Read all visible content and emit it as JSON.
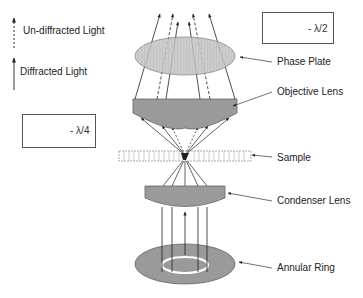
{
  "legend": {
    "undiffracted": "Un-diffracted Light",
    "diffracted": "Diffracted Light"
  },
  "phase_boxes": {
    "top_right": "- λ/2",
    "left": "- λ/4"
  },
  "labels": {
    "phase_plate": "Phase Plate",
    "objective_lens": "Objective Lens",
    "sample": "Sample",
    "condenser_lens": "Condenser Lens",
    "annular_ring": "Annular Ring"
  },
  "colors": {
    "component_fill": "#9a9a9a",
    "phase_plate_fill": "#bdbdbd",
    "line": "#222222"
  }
}
